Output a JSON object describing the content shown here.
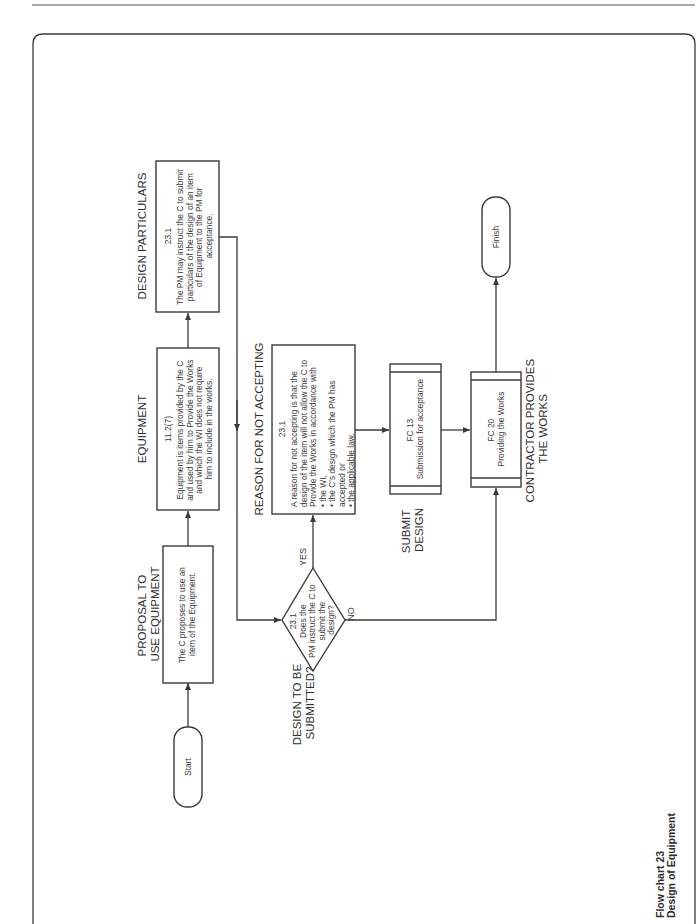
{
  "caption": {
    "line1": "Flow chart 23",
    "line2": "Design of Equipment"
  },
  "nodes": {
    "start": {
      "label": "Start"
    },
    "proposal": {
      "heading": [
        "PROPOSAL TO",
        "USE EQUIPMENT"
      ],
      "lines": [
        "The C proposes to use an",
        "item of the Equipment."
      ]
    },
    "equipment": {
      "heading": [
        "EQUIPMENT"
      ],
      "ref": "11.2(7)",
      "lines": [
        "Equipment is items provided by the C",
        "and used by him to Provide the Works",
        "and which the WI does not require",
        "him to include in the works."
      ]
    },
    "design_particulars": {
      "heading": [
        "DESIGN PARTICULARS"
      ],
      "ref": "23.1",
      "lines": [
        "The PM may instruct the C to submit",
        "particulars of the design of an item",
        "of Equipment to the PM for",
        "acceptance."
      ]
    },
    "decision": {
      "heading": [
        "DESIGN TO BE",
        "SUBMITTED?"
      ],
      "lines": [
        "23.1",
        "Does the",
        "PM instruct the C to",
        "submit the",
        "design?"
      ],
      "yes": "YES",
      "no": "NO"
    },
    "reason": {
      "heading": [
        "REASON FOR NOT ACCEPTING"
      ],
      "ref": "23.1",
      "lines": [
        "A reason for not accepting is that the",
        "design of the item will not allow the C to",
        "Provide the Works in accordance with",
        "• the WI,",
        "• the C's design which the PM has",
        "   accepted or",
        "• the applicable law."
      ]
    },
    "fc13": {
      "heading": [
        "SUBMIT",
        "DESIGN"
      ],
      "lines": [
        "FC 13",
        "Submission for acceptance"
      ]
    },
    "fc20": {
      "heading": [
        "CONTRACTOR PROVIDES",
        "THE WORKS"
      ],
      "lines": [
        "FC 20",
        "Providing the Works"
      ]
    },
    "finish": {
      "label": "Finish"
    }
  },
  "colors": {
    "line": "#3a3a3a",
    "text": "#2e2e2e",
    "background": "#ffffff"
  }
}
